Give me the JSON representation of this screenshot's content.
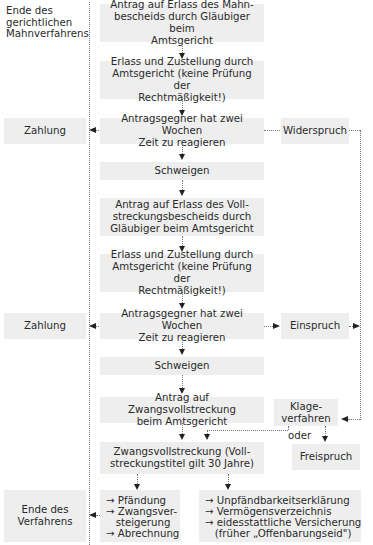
{
  "left_labels": {
    "end_dunning": [
      "Ende des",
      "gerichtlichen",
      "Mahnverfahrens"
    ]
  },
  "steps": {
    "s1": [
      "Antrag auf Erlass des Mahn-",
      "bescheids durch Gläubiger beim",
      "Amtsgericht"
    ],
    "s2": [
      "Erlass und Zustellung durch",
      "Amtsgericht (keine Prüfung der",
      "Rechtmäßigkeit!)"
    ],
    "s3": [
      "Antragsgegner hat zwei Wochen",
      "Zeit zu reagieren"
    ],
    "s4": [
      "Schweigen"
    ],
    "s5": [
      "Antrag auf Erlass des Voll-",
      "streckungsbescheids durch",
      "Gläubiger beim Amtsgericht"
    ],
    "s6": [
      "Erlass und Zustellung durch",
      "Amtsgericht (keine Prüfung der",
      "Rechtmäßigkeit!)"
    ],
    "s7": [
      "Antragsgegner hat zwei Wochen",
      "Zeit zu reagieren"
    ],
    "s8": [
      "Schweigen"
    ],
    "s9": [
      "Antrag auf Zwangsvollstreckung",
      "beim Amtsgericht"
    ],
    "s10": [
      "Zwangsvollstreckung (Voll-",
      "streckungstitel gilt 30 Jahre)"
    ]
  },
  "side": {
    "payment1": "Zahlung",
    "objection": "Widerspruch",
    "payment2": "Zahlung",
    "appeal": "Einspruch",
    "lawsuit": [
      "Klage-",
      "verfahren"
    ],
    "or_label": "oder",
    "acquittal": "Freispruch",
    "end_procedure": [
      "Ende des",
      "Verfahrens"
    ]
  },
  "outcomes": {
    "left_list": [
      "→ Pfändung",
      "→ Zwangsver-",
      "   steigerung",
      "→ Abrechnung"
    ],
    "right_list": [
      "→ Unpfändbarkeitserklärung",
      "→ Vermögensverzeichnis",
      "→ eidesstattliche Versicherung",
      "   (früher „Offenbarungseid\")"
    ]
  }
}
